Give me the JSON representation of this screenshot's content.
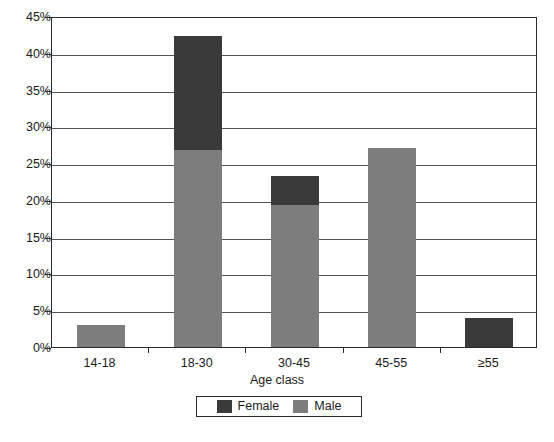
{
  "chart_data": {
    "type": "bar",
    "subtype": "stacked-bar",
    "title": "",
    "xlabel": "Age class",
    "ylabel": "",
    "categories": [
      "14-18",
      "18-30",
      "30-45",
      "45-55",
      "≥55"
    ],
    "series": [
      {
        "name": "Male",
        "color": "#7d7d7d",
        "values": [
          3.0,
          26.8,
          19.3,
          27.1,
          0.0
        ]
      },
      {
        "name": "Female",
        "color": "#3a3a3a",
        "values": [
          0.0,
          15.5,
          3.9,
          0.0,
          3.9
        ]
      }
    ],
    "totals": [
      3.0,
      42.3,
      23.2,
      27.1,
      3.9
    ],
    "ylim": [
      0,
      45
    ],
    "ytick_values": [
      0,
      5,
      10,
      15,
      20,
      25,
      30,
      35,
      40,
      45
    ],
    "ytick_labels": [
      "0%",
      "5%",
      "10%",
      "15%",
      "20%",
      "25%",
      "30%",
      "35%",
      "40%",
      "45%"
    ],
    "grid": true,
    "grid_axis": "y",
    "legend_position": "bottom-center",
    "legend_entries": [
      "Female",
      "Male"
    ],
    "stack_order_bottom_to_top": [
      "Male",
      "Female"
    ]
  },
  "axes": {
    "y_axis_name": "percentage-axis",
    "x_axis_name": "age-class-axis"
  },
  "caption": {
    "text": ""
  },
  "colors": {
    "female": "#3a3a3a",
    "male": "#7d7d7d",
    "grid": "#545454",
    "frame": "#2b2b2b",
    "background": "#ffffff"
  }
}
